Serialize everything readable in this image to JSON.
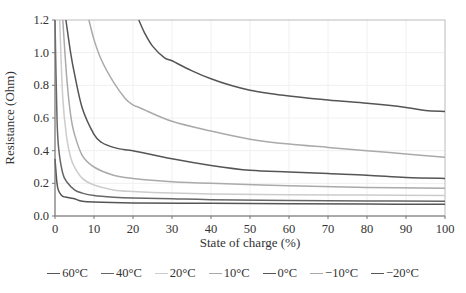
{
  "chart_data": {
    "type": "line",
    "title": "",
    "xlabel": "State of charge (%)",
    "ylabel": "Resistance (Ohm)",
    "xlim": [
      0,
      100
    ],
    "ylim": [
      0,
      1.2
    ],
    "xticks": [
      0,
      10,
      20,
      30,
      40,
      50,
      60,
      70,
      80,
      90,
      100
    ],
    "yticks": [
      "0.0",
      "0.2",
      "0.4",
      "0.6",
      "0.8",
      "1.0",
      "1.2"
    ],
    "grid": true,
    "legend_position": "bottom",
    "series": [
      {
        "name": "60°C",
        "color": "#555555",
        "x": [
          0,
          0.5,
          1,
          2,
          3,
          4,
          5,
          7,
          10,
          20,
          40,
          60,
          80,
          100
        ],
        "y": [
          0.35,
          0.2,
          0.15,
          0.12,
          0.115,
          0.11,
          0.105,
          0.09,
          0.085,
          0.08,
          0.078,
          0.075,
          0.073,
          0.072
        ]
      },
      {
        "name": "40°C",
        "color": "#666666",
        "x": [
          0,
          0.5,
          1,
          2,
          3,
          5,
          7,
          10,
          15,
          20,
          30,
          40,
          60,
          80,
          100
        ],
        "y": [
          1.2,
          0.6,
          0.4,
          0.26,
          0.21,
          0.16,
          0.14,
          0.125,
          0.115,
          0.11,
          0.105,
          0.1,
          0.095,
          0.092,
          0.09
        ]
      },
      {
        "name": "20°C",
        "color": "#cccccc",
        "x": [
          1.2,
          2,
          3,
          4,
          5,
          7,
          10,
          15,
          20,
          30,
          40,
          60,
          80,
          100
        ],
        "y": [
          1.2,
          0.72,
          0.48,
          0.36,
          0.3,
          0.23,
          0.19,
          0.16,
          0.15,
          0.14,
          0.135,
          0.13,
          0.128,
          0.125
        ]
      },
      {
        "name": "10°C",
        "color": "#aaaaaa",
        "x": [
          2,
          3,
          4,
          5,
          7,
          10,
          15,
          20,
          30,
          40,
          60,
          80,
          100
        ],
        "y": [
          1.2,
          0.85,
          0.62,
          0.5,
          0.37,
          0.3,
          0.25,
          0.23,
          0.21,
          0.2,
          0.185,
          0.175,
          0.17
        ]
      },
      {
        "name": "0°C",
        "color": "#555555",
        "x": [
          2.8,
          4,
          5,
          7,
          10,
          12,
          15,
          18,
          20,
          30,
          40,
          50,
          60,
          70,
          80,
          90,
          100
        ],
        "y": [
          1.2,
          1.0,
          0.87,
          0.66,
          0.5,
          0.45,
          0.42,
          0.405,
          0.4,
          0.35,
          0.31,
          0.28,
          0.27,
          0.26,
          0.25,
          0.235,
          0.23
        ]
      },
      {
        "name": "−10°C",
        "color": "#aaaaaa",
        "x": [
          8.7,
          10,
          12,
          15,
          18,
          20,
          22,
          30,
          40,
          50,
          60,
          70,
          80,
          90,
          100
        ],
        "y": [
          1.2,
          1.08,
          0.95,
          0.82,
          0.72,
          0.68,
          0.66,
          0.58,
          0.52,
          0.47,
          0.44,
          0.42,
          0.4,
          0.38,
          0.36
        ]
      },
      {
        "name": "−20°C",
        "color": "#555555",
        "x": [
          21.5,
          23,
          25,
          28,
          30,
          35,
          40,
          45,
          50,
          55,
          60,
          70,
          80,
          90,
          95,
          100
        ],
        "y": [
          1.2,
          1.12,
          1.04,
          0.97,
          0.95,
          0.89,
          0.84,
          0.8,
          0.77,
          0.75,
          0.735,
          0.71,
          0.69,
          0.665,
          0.645,
          0.64
        ]
      }
    ]
  },
  "legend": {
    "items": [
      {
        "label": "60°C",
        "color": "#555555"
      },
      {
        "label": "40°C",
        "color": "#666666"
      },
      {
        "label": "20°C",
        "color": "#cccccc"
      },
      {
        "label": "10°C",
        "color": "#aaaaaa"
      },
      {
        "label": "0°C",
        "color": "#555555"
      },
      {
        "label": "−10°C",
        "color": "#aaaaaa"
      },
      {
        "label": "−20°C",
        "color": "#555555"
      }
    ]
  }
}
